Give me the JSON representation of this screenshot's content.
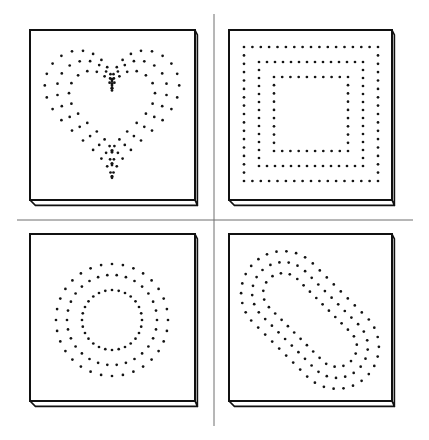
{
  "figure": {
    "background": "#ffffff",
    "ink_color": "#141414",
    "divider_color": "#6f6f6f",
    "dividers": {
      "horizontal": {
        "x1": 17,
        "x2": 413,
        "y": 220
      },
      "vertical": {
        "x": 214,
        "y1": 14,
        "y2": 426
      }
    },
    "edge_thickness": 6,
    "panels": [
      {
        "id": "heart",
        "label": "heart-pattern",
        "board": {
          "x": 30,
          "y": 30,
          "w": 165,
          "h": 170
        },
        "shape": {
          "type": "heart",
          "cx": 112,
          "cy": 103,
          "scales": [
            1.0,
            0.82,
            0.64
          ],
          "counts": [
            44,
            38,
            32
          ]
        }
      },
      {
        "id": "square",
        "label": "square-pattern",
        "board": {
          "x": 229,
          "y": 30,
          "w": 163,
          "h": 170
        },
        "shape": {
          "type": "square",
          "cx": 311,
          "cy": 114,
          "half_sizes": [
            67,
            52,
            37
          ],
          "spacing": [
            8.5,
            8.0,
            7.8
          ]
        }
      },
      {
        "id": "circle",
        "label": "circle-pattern",
        "board": {
          "x": 30,
          "y": 234,
          "w": 165,
          "h": 167
        },
        "shape": {
          "type": "circle",
          "cx": 112,
          "cy": 320,
          "radii": [
            56,
            45,
            30
          ],
          "counts": [
            32,
            30,
            28
          ]
        }
      },
      {
        "id": "oval",
        "label": "oval-pattern",
        "board": {
          "x": 229,
          "y": 234,
          "w": 163,
          "h": 167
        },
        "shape": {
          "type": "stadium",
          "cx": 310,
          "cy": 320,
          "angle_deg": 45,
          "half_length": 38,
          "radii": [
            42,
            31,
            20
          ],
          "spacing": [
            10,
            9.5,
            9
          ]
        }
      }
    ]
  }
}
